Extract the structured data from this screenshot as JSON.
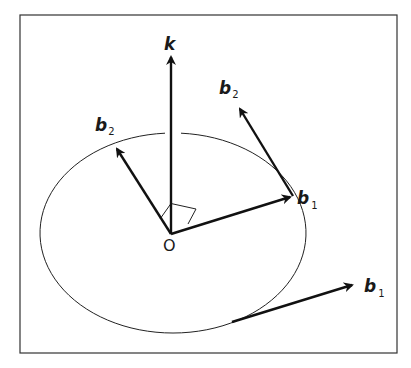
{
  "figure": {
    "frame": {
      "stroke": "#333333"
    },
    "ink_color": "#111111",
    "origin_label": "O",
    "vectors": [
      {
        "id": "k",
        "label": "k",
        "subscript": ""
      },
      {
        "id": "b2-inner",
        "label": "b",
        "subscript": "2"
      },
      {
        "id": "b1-inner",
        "label": "b",
        "subscript": "1"
      },
      {
        "id": "b2-tangent",
        "label": "b",
        "subscript": "2"
      },
      {
        "id": "b1-lower",
        "label": "b",
        "subscript": "1"
      }
    ],
    "annotations": {
      "right_angle_marker": true,
      "ellipse": "orbit / ellipse centered at O"
    }
  }
}
